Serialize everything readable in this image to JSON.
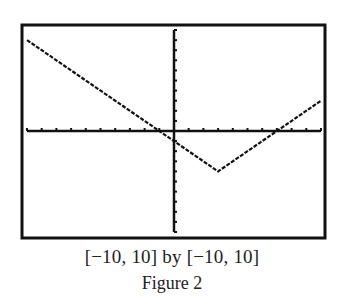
{
  "figure": {
    "window_caption": "[−10, 10] by [−10, 10]",
    "label": "Figure 2"
  },
  "colors": {
    "ink": "#111111",
    "background": "#ffffff"
  },
  "chart_data": {
    "type": "line",
    "title": "",
    "xlabel": "",
    "ylabel": "",
    "xlim": [
      -10,
      10
    ],
    "ylim": [
      -10,
      10
    ],
    "grid": false,
    "tick_step": 1,
    "legend": null,
    "annotations": [
      "[−10, 10] by [−10, 10]",
      "Figure 2"
    ],
    "series": [
      {
        "name": "y = |x - 3| - 4",
        "x": [
          -10,
          -1,
          3,
          7,
          10
        ],
        "y": [
          9,
          0,
          -4,
          0,
          3
        ]
      }
    ],
    "vertex": [
      3,
      -4
    ],
    "x_intercepts": [
      -1,
      7
    ],
    "y_intercept": -1
  }
}
